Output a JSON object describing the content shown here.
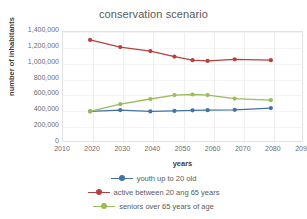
{
  "chart_data": {
    "type": "line",
    "title": "conservation scenario",
    "xlabel": "years",
    "ylabel": "number of inhabitants",
    "xlim": [
      2010,
      2090
    ],
    "ylim": [
      0,
      1400000
    ],
    "xticks": [
      "2010",
      "2020",
      "2030",
      "2040",
      "2050",
      "2060",
      "2070",
      "2080",
      "2090"
    ],
    "xtick_values": [
      2010,
      2020,
      2030,
      2040,
      2050,
      2060,
      2070,
      2080,
      2090
    ],
    "yticks": [
      "0",
      "200,000",
      "400,000",
      "600,000",
      "800,000",
      "1,000,000",
      "1,200,000",
      "1,400,000"
    ],
    "ytick_values": [
      0,
      200000,
      400000,
      600000,
      800000,
      1000000,
      1200000,
      1400000
    ],
    "grid": true,
    "legend_position": "bottom",
    "x": [
      2019,
      2029,
      2039,
      2047,
      2053,
      2058,
      2067,
      2079
    ],
    "series": [
      {
        "name": "youth up to 20 old",
        "color": "#4372A3",
        "values": [
          400000,
          415000,
          398000,
          405000,
          412000,
          414000,
          418000,
          440000
        ]
      },
      {
        "name": "active between 20 ang 65 years",
        "color": "#B8403C",
        "values": [
          1300000,
          1210000,
          1160000,
          1090000,
          1045000,
          1035000,
          1055000,
          1045000
        ]
      },
      {
        "name": "seniors over 65 years of age",
        "color": "#9BBB59",
        "values": [
          400000,
          490000,
          555000,
          605000,
          612000,
          605000,
          560000,
          540000
        ]
      }
    ]
  },
  "legend": {
    "items": [
      {
        "label": "youth up to 20 old",
        "color": "#4372A3"
      },
      {
        "label": "active between 20 ang 65 years",
        "color": "#B8403C"
      },
      {
        "label": "seniors over 65 years of age",
        "color": "#9BBB59"
      }
    ]
  }
}
